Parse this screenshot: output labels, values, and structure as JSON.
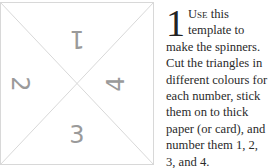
{
  "template": {
    "numbers": {
      "top": "1",
      "left": "2",
      "bottom": "3",
      "right": "4"
    },
    "line_color": "#d8d8d8",
    "number_color": "#9a9a9a"
  },
  "instruction": {
    "step": "1",
    "lead": "Use",
    "body": " this template to make the spinners. Cut the triangles in different colours for each number, stick them on to thick paper (or card), and number them 1, 2, 3, and 4."
  }
}
